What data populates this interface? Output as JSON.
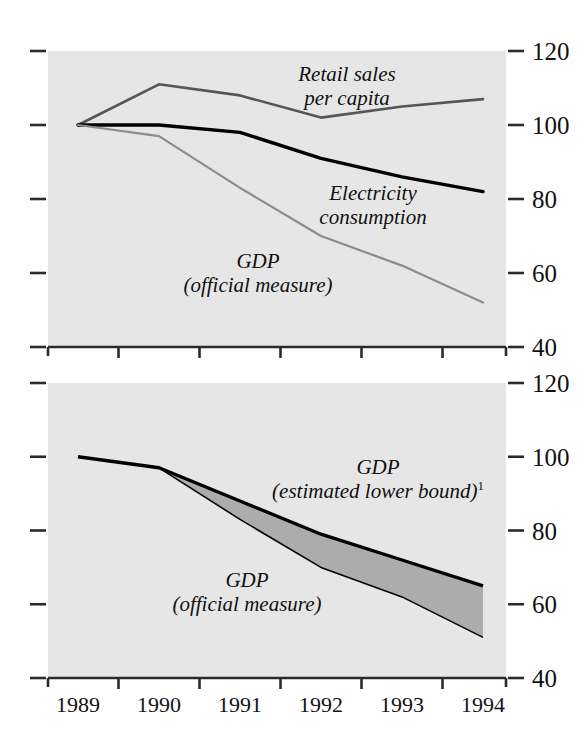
{
  "figure": {
    "panels": [
      {
        "id": "top",
        "name": "indicators-panel",
        "y_axis": {
          "labels": [
            "120",
            "100",
            "80",
            "60",
            "40"
          ],
          "values": [
            120,
            100,
            80,
            60,
            40
          ],
          "min": 40,
          "max": 120,
          "tick_step": 20
        },
        "x_axis": {
          "labels": [
            "1989",
            "1990",
            "1991",
            "1992",
            "1993",
            "1994"
          ],
          "values": [
            1989,
            1990,
            1991,
            1992,
            1993,
            1994
          ]
        },
        "annotations": [
          {
            "id": "retail",
            "line1": "Retail sales",
            "line2": "per capita",
            "sup": ""
          },
          {
            "id": "electricity",
            "line1": "Electricity",
            "line2": "consumption",
            "sup": ""
          },
          {
            "id": "gdp-official",
            "line1": "GDP",
            "line2": "(official measure)",
            "sup": ""
          }
        ]
      },
      {
        "id": "bottom",
        "name": "gdp-range-panel",
        "y_axis": {
          "labels": [
            "120",
            "100",
            "80",
            "60",
            "40"
          ],
          "values": [
            120,
            100,
            80,
            60,
            40
          ],
          "min": 40,
          "max": 120,
          "tick_step": 20
        },
        "x_axis": {
          "labels": [
            "1989",
            "1990",
            "1991",
            "1992",
            "1993",
            "1994"
          ],
          "values": [
            1989,
            1990,
            1991,
            1992,
            1993,
            1994
          ]
        },
        "annotations": [
          {
            "id": "gdp-lower-bound",
            "line1": "GDP",
            "line2": "(estimated lower bound)",
            "sup": "1"
          },
          {
            "id": "gdp-official",
            "line1": "GDP",
            "line2": "(official measure)",
            "sup": ""
          }
        ]
      }
    ],
    "colors": {
      "plot_background": "#e6e6e6",
      "page_background": "#ffffff",
      "axis": "#2b2b2b",
      "retail_sales": "#555555",
      "electricity": "#000000",
      "gdp_official": "#8c8c8c",
      "gdp_lower_bound": "#000000",
      "band_fill": "#a9a9a9"
    }
  },
  "chart_data": [
    {
      "type": "line",
      "panel": "top",
      "title": "",
      "xlabel": "",
      "ylabel": "",
      "x": [
        1989,
        1990,
        1991,
        1992,
        1993,
        1994
      ],
      "categories": [
        "1989",
        "1990",
        "1991",
        "1992",
        "1993",
        "1994"
      ],
      "xlim": [
        1989,
        1994
      ],
      "ylim": [
        40,
        120
      ],
      "ytick_values": [
        40,
        60,
        80,
        100,
        120
      ],
      "grid": false,
      "legend": "inline-annotations",
      "series": [
        {
          "name": "Retail sales per capita",
          "color": "#555555",
          "values": [
            100,
            111,
            108,
            102,
            105,
            107
          ]
        },
        {
          "name": "Electricity consumption",
          "color": "#000000",
          "values": [
            100,
            100,
            98,
            91,
            86,
            82
          ]
        },
        {
          "name": "GDP (official measure)",
          "color": "#8c8c8c",
          "values": [
            100,
            97,
            83,
            70,
            62,
            52
          ]
        }
      ]
    },
    {
      "type": "area",
      "panel": "bottom",
      "title": "",
      "xlabel": "",
      "ylabel": "",
      "x": [
        1989,
        1990,
        1991,
        1992,
        1993,
        1994
      ],
      "categories": [
        "1989",
        "1990",
        "1991",
        "1992",
        "1993",
        "1994"
      ],
      "xlim": [
        1989,
        1994
      ],
      "ylim": [
        40,
        120
      ],
      "ytick_values": [
        40,
        60,
        80,
        100,
        120
      ],
      "grid": false,
      "legend": "inline-annotations",
      "band_between": [
        "GDP (estimated lower bound)",
        "GDP (official measure)"
      ],
      "series": [
        {
          "name": "GDP (estimated lower bound)",
          "color": "#000000",
          "values": [
            100,
            97,
            88,
            79,
            72,
            65
          ]
        },
        {
          "name": "GDP (official measure)",
          "color": "#000000",
          "values": [
            100,
            97,
            83,
            70,
            62,
            51
          ]
        }
      ]
    }
  ]
}
